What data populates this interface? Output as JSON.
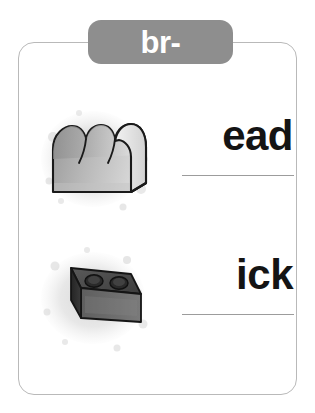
{
  "worksheet": {
    "title": "br- blend phonics worksheet",
    "header": {
      "label": "br-",
      "background_color": "#8e8e8e",
      "text_color": "#ffffff"
    },
    "card": {
      "border_color": "#b9b9b9",
      "background_color": "#ffffff"
    },
    "rows": [
      {
        "id": "bread",
        "picture_name": "bread-loaf-illustration",
        "picture_alt": "loaf of bread",
        "word_ending": "ead",
        "full_word": "bread",
        "has_blank_line": true
      },
      {
        "id": "brick",
        "picture_name": "brick-illustration",
        "picture_alt": "brick with two holes",
        "word_ending": "ick",
        "full_word": "brick",
        "has_blank_line": true
      }
    ],
    "colors": {
      "word_text": "#141414",
      "blank_line": "#9c9c9c",
      "splotch": "#cfcfcf",
      "bread_light": "#ededed",
      "bread_mid": "#b5b5b5",
      "bread_dark": "#868686",
      "brick_top": "#4c4c4c",
      "brick_front": "#6a6a6a",
      "brick_side": "#2e2e2e",
      "outline": "#1a1a1a"
    }
  }
}
